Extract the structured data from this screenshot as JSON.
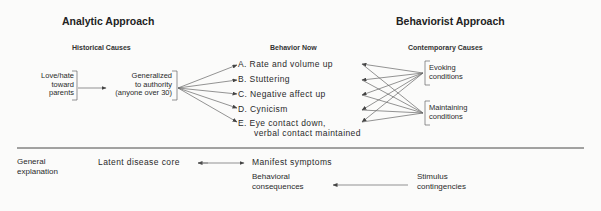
{
  "headers": {
    "analytic": "Analytic Approach",
    "behaviorist": "Behaviorist Approach"
  },
  "columns": {
    "historical": "Historical Causes",
    "behavior_now": "Behavior Now",
    "contemporary": "Contemporary Causes"
  },
  "historical_causes": {
    "origin": [
      "Love/hate",
      "toward",
      "parents"
    ],
    "generalized": [
      "Generalized",
      "to authority",
      "(anyone over 30)"
    ]
  },
  "behaviors": [
    {
      "letter": "A.",
      "text": "Rate and volume up"
    },
    {
      "letter": "B.",
      "text": "Stuttering"
    },
    {
      "letter": "C.",
      "text": "Negative affect up"
    },
    {
      "letter": "D.",
      "text": "Cynicism"
    },
    {
      "letter": "E.",
      "text": "Eye contact down,",
      "text2": "verbal contact maintained"
    }
  ],
  "contemporary_causes": {
    "evoking": [
      "Evoking",
      "conditions"
    ],
    "maintaining": [
      "Maintaining",
      "conditions"
    ]
  },
  "bottom": {
    "row_label": [
      "General",
      "explanation"
    ],
    "latent": "Latent disease core",
    "manifest": "Manifest symptoms",
    "behavioral": [
      "Behavioral",
      "consequences"
    ],
    "stimulus": [
      "Stimulus",
      "contingencies"
    ]
  }
}
